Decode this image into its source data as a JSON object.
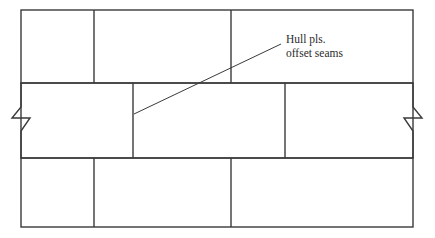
{
  "figure": {
    "background_color": "#ffffff",
    "line_color": "#3a3a3a",
    "text_color": "#2b2b2b",
    "line_width": 1.4,
    "width": 435,
    "height": 238
  },
  "annotation": {
    "line1": "Hull pls.",
    "line2": "offset seams",
    "text_x": 286,
    "line1_y": 43,
    "line2_y": 57,
    "leader": {
      "from_x": 134,
      "from_y": 114,
      "to_x": 281,
      "to_y": 44
    }
  },
  "panel": {
    "left": 21,
    "right": 413,
    "top": 10,
    "bottom": 227,
    "band_top_y": 83,
    "band_bottom_y": 158
  },
  "bands": [
    {
      "name": "upper-strake",
      "y_top": 10,
      "y_bottom": 83,
      "x_start": 21,
      "x_end": 413,
      "seams_x": [
        94,
        231
      ]
    },
    {
      "name": "middle-strake",
      "y_top": 83,
      "y_bottom": 158,
      "x_start": 21,
      "x_end": 413,
      "seams_x": [
        133,
        285
      ]
    },
    {
      "name": "lower-strake",
      "y_top": 158,
      "y_bottom": 227,
      "x_start": 21,
      "x_end": 413,
      "seams_x": [
        94,
        231
      ]
    }
  ],
  "break_symbols": [
    {
      "name": "left-break-symbol",
      "side": "left",
      "x": 21,
      "y_top": 83,
      "y_bottom": 158,
      "zig_out_x": 12,
      "zig_in_x": 30,
      "zig_y1": 107,
      "zig_y2": 118,
      "zig_y3": 131
    },
    {
      "name": "right-break-symbol",
      "side": "right",
      "x": 413,
      "y_top": 83,
      "y_bottom": 158,
      "zig_out_x": 422,
      "zig_in_x": 404,
      "zig_y1": 107,
      "zig_y2": 118,
      "zig_y3": 131
    }
  ]
}
